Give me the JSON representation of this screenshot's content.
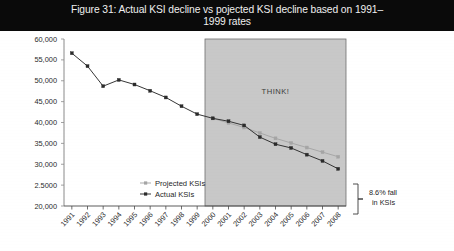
{
  "title": {
    "text": "Figure 31: Actual KSI decline vs pojected KSI decline based on 1991–1999 rates",
    "line1": "Figure 31: Actual KSI decline vs pojected KSI decline based on 1991–",
    "line2": "1999 rates",
    "background_color": "#0a0a0a",
    "text_color": "#efefef"
  },
  "annotations": {
    "shaded_region_label": "THINK!",
    "bracket_label_line1": "8.6% fall",
    "bracket_label_line2": "in KSIs",
    "bracket_label": "8.6% fall in KSIs"
  },
  "colors": {
    "actual": "#2b2b2b",
    "projected": "#a5a5a5",
    "shaded_region": "#c8c8c8",
    "shaded_region_border": "#6e6e6e",
    "axis": "#8a8a8a",
    "tick_text": "#2b2b2b"
  },
  "chart_data": {
    "type": "line",
    "xlabel": "",
    "ylabel": "",
    "grid": false,
    "legend_position": "inside-bottom-left",
    "x": [
      "1991",
      "1992",
      "1993",
      "1994",
      "1995",
      "1996",
      "1997",
      "1998",
      "1999",
      "2000",
      "2001",
      "2002",
      "2003",
      "2004",
      "2005",
      "2006",
      "2007",
      "2008"
    ],
    "ylim": [
      20000,
      60000
    ],
    "ytick_values": [
      20000,
      25000,
      30000,
      35000,
      40000,
      45000,
      50000,
      55000,
      60000
    ],
    "ytick_labels": [
      "20,000",
      "2.5000",
      "30,000",
      "35,000",
      "40,000",
      "45,000",
      "50,000",
      "55,000",
      "60,000"
    ],
    "xtick_labels": [
      "1991",
      "1992",
      "1993",
      "1994",
      "1995",
      "1996",
      "1997",
      "1998",
      "1999",
      "2000",
      "2001",
      "2002",
      "2003",
      "2004",
      "2005",
      "2006",
      "2007",
      "2008"
    ],
    "series": [
      {
        "name": "Projected KSIs",
        "color": "#a5a5a5",
        "marker": "square",
        "values": [
          null,
          null,
          null,
          null,
          null,
          null,
          null,
          null,
          null,
          41000,
          39900,
          38800,
          37500,
          36200,
          35100,
          34000,
          32900,
          31800
        ]
      },
      {
        "name": "Actual KSIs",
        "color": "#2b2b2b",
        "marker": "square",
        "values": [
          56600,
          53500,
          48700,
          50200,
          49100,
          47600,
          46000,
          43900,
          42000,
          41000,
          40300,
          39300,
          36500,
          34800,
          33900,
          32300,
          30800,
          28900
        ]
      }
    ],
    "shaded_region": {
      "label": "THINK!",
      "x_start": "2000",
      "x_end": "2008",
      "fill": "#c8c8c8"
    },
    "bracket_annotation": {
      "label": "8.6% fall in KSIs",
      "between_series": [
        "Projected KSIs",
        "Actual KSIs"
      ],
      "at_x": "2008"
    }
  }
}
